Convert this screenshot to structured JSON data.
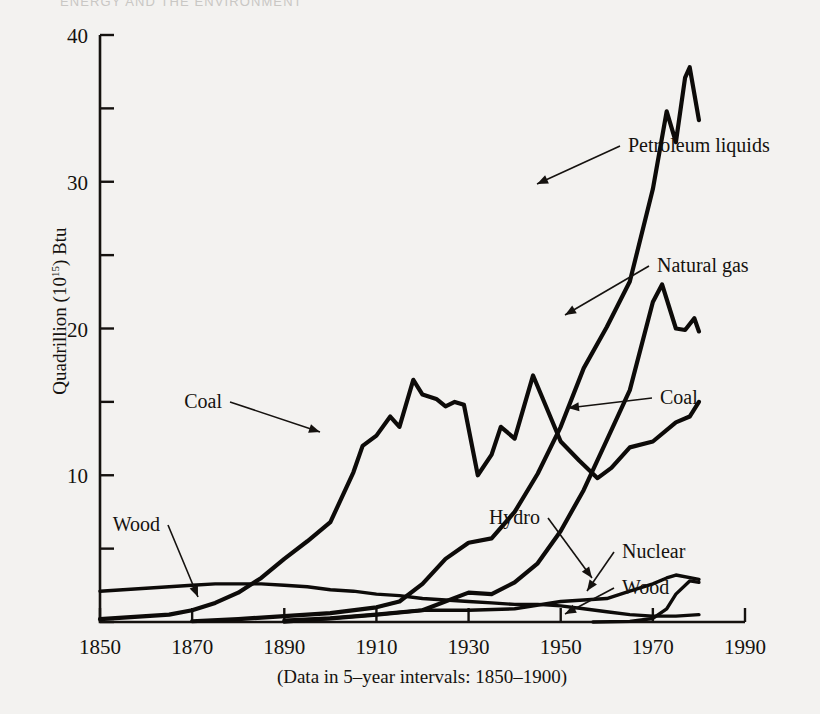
{
  "page": {
    "running_head": "ENERGY AND THE ENVIRONMENT",
    "background_color": "#f3f2f0",
    "ink_color": "#15120f"
  },
  "chart_data": {
    "type": "line",
    "title": "",
    "subtitle": "",
    "xlabel": "",
    "ylabel": "Quadrillion (10¹⁵) Btu",
    "ylabel_prefix": "Quadrillion (10",
    "ylabel_exponent": "15",
    "ylabel_suffix": ") Btu",
    "caption": "(Data in 5–year intervals:  1850–1900)",
    "xlim": [
      1850,
      1990
    ],
    "ylim": [
      0,
      40
    ],
    "xticks": [
      1850,
      1870,
      1890,
      1910,
      1930,
      1950,
      1970,
      1990
    ],
    "xtick_labels": [
      "1850",
      "1870",
      "1890",
      "1910",
      "1930",
      "1950",
      "1970",
      "1990"
    ],
    "yticks": [
      0,
      10,
      20,
      30,
      40
    ],
    "ytick_labels": [
      "",
      "10",
      "20",
      "30",
      "40"
    ],
    "yticks_minor": [
      5,
      15,
      25,
      35
    ],
    "grid": false,
    "legend": "none",
    "annotations": [
      {
        "name": "petroleum-liquids",
        "label": "Petroleum liquids",
        "text_x": 628,
        "text_y": 152,
        "point_x": 537,
        "point_y": 184
      },
      {
        "name": "natural-gas",
        "label": "Natural gas",
        "text_x": 657,
        "text_y": 272,
        "point_x": 565,
        "point_y": 315
      },
      {
        "name": "coal-right",
        "label": "Coal",
        "text_x": 660,
        "text_y": 404,
        "point_x": 568,
        "point_y": 408
      },
      {
        "name": "coal-left",
        "label": "Coal",
        "text_x": 222,
        "text_y": 408,
        "point_x": 320,
        "point_y": 432
      },
      {
        "name": "wood-left",
        "label": "Wood",
        "text_x": 160,
        "text_y": 531,
        "point_x": 198,
        "point_y": 597
      },
      {
        "name": "hydro",
        "label": "Hydro",
        "text_x": 540,
        "text_y": 524,
        "point_x": 592,
        "point_y": 578
      },
      {
        "name": "nuclear",
        "label": "Nuclear",
        "text_x": 622,
        "text_y": 558,
        "point_x": 587,
        "point_y": 591
      },
      {
        "name": "wood-right",
        "label": "Wood",
        "text_x": 622,
        "text_y": 594,
        "point_x": 565,
        "point_y": 614
      }
    ],
    "series": [
      {
        "name": "Wood",
        "x": [
          1850,
          1855,
          1860,
          1865,
          1870,
          1875,
          1880,
          1885,
          1890,
          1895,
          1900,
          1905,
          1910,
          1915,
          1920,
          1925,
          1930,
          1935,
          1940,
          1945,
          1950,
          1955,
          1960,
          1965,
          1970,
          1975,
          1980
        ],
        "values": [
          2.1,
          2.2,
          2.3,
          2.4,
          2.5,
          2.6,
          2.6,
          2.6,
          2.5,
          2.4,
          2.2,
          2.1,
          1.9,
          1.8,
          1.6,
          1.5,
          1.4,
          1.3,
          1.2,
          1.2,
          1.1,
          0.9,
          0.7,
          0.5,
          0.4,
          0.4,
          0.5
        ]
      },
      {
        "name": "Coal",
        "x": [
          1850,
          1855,
          1860,
          1865,
          1870,
          1875,
          1880,
          1885,
          1890,
          1895,
          1900,
          1905,
          1907,
          1910,
          1913,
          1915,
          1918,
          1920,
          1923,
          1925,
          1927,
          1929,
          1932,
          1935,
          1937,
          1940,
          1944,
          1946,
          1950,
          1954,
          1958,
          1961,
          1965,
          1970,
          1975,
          1978,
          1980
        ],
        "values": [
          0.2,
          0.3,
          0.4,
          0.5,
          0.8,
          1.3,
          2.0,
          3.0,
          4.3,
          5.5,
          6.8,
          10.2,
          12.0,
          12.7,
          14.0,
          13.3,
          16.5,
          15.5,
          15.2,
          14.7,
          15.0,
          14.8,
          10.0,
          11.4,
          13.3,
          12.5,
          16.8,
          15.3,
          12.3,
          11.0,
          9.8,
          10.5,
          11.9,
          12.3,
          13.6,
          14.0,
          15.0
        ]
      },
      {
        "name": "Petroleum liquids",
        "x": [
          1870,
          1880,
          1890,
          1900,
          1910,
          1915,
          1920,
          1925,
          1930,
          1935,
          1940,
          1945,
          1950,
          1955,
          1960,
          1965,
          1970,
          1973,
          1975,
          1977,
          1978,
          1980
        ],
        "values": [
          0.05,
          0.2,
          0.4,
          0.6,
          1.0,
          1.4,
          2.6,
          4.3,
          5.4,
          5.7,
          7.5,
          10.1,
          13.3,
          17.3,
          20.1,
          23.2,
          29.5,
          34.8,
          32.7,
          37.1,
          37.8,
          34.2
        ]
      },
      {
        "name": "Natural gas",
        "x": [
          1890,
          1900,
          1910,
          1920,
          1930,
          1935,
          1940,
          1945,
          1950,
          1955,
          1960,
          1965,
          1970,
          1972,
          1975,
          1977,
          1979,
          1980
        ],
        "values": [
          0.1,
          0.25,
          0.5,
          0.8,
          2.0,
          1.9,
          2.7,
          4.0,
          6.2,
          9.0,
          12.4,
          15.8,
          21.8,
          23.0,
          20.0,
          19.9,
          20.7,
          19.8
        ]
      },
      {
        "name": "Hydro",
        "x": [
          1890,
          1900,
          1910,
          1920,
          1930,
          1940,
          1950,
          1960,
          1965,
          1970,
          1973,
          1975,
          1980
        ],
        "values": [
          0.0,
          0.25,
          0.5,
          0.8,
          0.8,
          0.9,
          1.4,
          1.6,
          2.1,
          2.6,
          3.0,
          3.2,
          2.9
        ]
      },
      {
        "name": "Nuclear",
        "x": [
          1957,
          1965,
          1970,
          1973,
          1975,
          1978,
          1980
        ],
        "values": [
          0.0,
          0.04,
          0.24,
          0.9,
          1.9,
          2.8,
          2.7
        ]
      }
    ]
  }
}
